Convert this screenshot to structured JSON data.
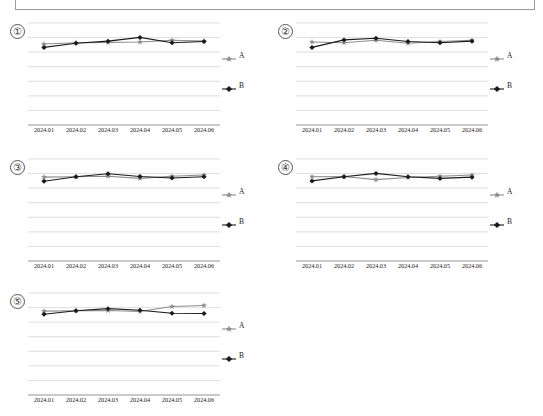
{
  "page": {
    "background": "#ffffff",
    "has_header_rule_box": true
  },
  "legend": {
    "series_a_label": "A",
    "series_b_label": "B",
    "series_a_color": "#8c8c8c",
    "series_b_color": "#1a1a1a",
    "series_a_marker": "star-marker-icon",
    "series_b_marker": "diamond-marker-icon"
  },
  "panels": [
    {
      "index_label": "①"
    },
    {
      "index_label": "②"
    },
    {
      "index_label": "③"
    },
    {
      "index_label": "④"
    },
    {
      "index_label": "⑤"
    }
  ],
  "chart_data": [
    {
      "type": "line",
      "title": "①",
      "xlabel": "",
      "ylabel": "",
      "categories": [
        "2024.01",
        "2024.02",
        "2024.03",
        "2024.04",
        "2024.05",
        "2024.06"
      ],
      "ylim": [
        0,
        8
      ],
      "grid": true,
      "gridlines": 8,
      "legend_position": "right",
      "series": [
        {
          "name": "A",
          "color": "#8c8c8c",
          "marker": "star",
          "values": [
            6.32,
            6.42,
            6.45,
            6.48,
            6.62,
            6.55
          ]
        },
        {
          "name": "B",
          "color": "#1a1a1a",
          "marker": "diamond",
          "values": [
            6.05,
            6.38,
            6.55,
            6.85,
            6.42,
            6.52
          ]
        }
      ]
    },
    {
      "type": "line",
      "title": "②",
      "xlabel": "",
      "ylabel": "",
      "categories": [
        "2024.01",
        "2024.02",
        "2024.03",
        "2024.04",
        "2024.05",
        "2024.06"
      ],
      "ylim": [
        0,
        8
      ],
      "grid": true,
      "gridlines": 8,
      "legend_position": "right",
      "series": [
        {
          "name": "A",
          "color": "#8c8c8c",
          "marker": "star",
          "values": [
            6.48,
            6.42,
            6.62,
            6.38,
            6.52,
            6.62
          ]
        },
        {
          "name": "B",
          "color": "#1a1a1a",
          "marker": "diamond",
          "values": [
            6.05,
            6.65,
            6.78,
            6.52,
            6.42,
            6.55
          ]
        }
      ]
    },
    {
      "type": "line",
      "title": "③",
      "xlabel": "",
      "ylabel": "",
      "categories": [
        "2024.01",
        "2024.02",
        "2024.03",
        "2024.04",
        "2024.05",
        "2024.06"
      ],
      "ylim": [
        0,
        8
      ],
      "grid": true,
      "gridlines": 8,
      "legend_position": "right",
      "series": [
        {
          "name": "A",
          "color": "#8c8c8c",
          "marker": "star",
          "values": [
            6.55,
            6.58,
            6.62,
            6.45,
            6.62,
            6.72
          ]
        },
        {
          "name": "B",
          "color": "#1a1a1a",
          "marker": "diamond",
          "values": [
            6.22,
            6.58,
            6.82,
            6.6,
            6.48,
            6.58
          ]
        }
      ]
    },
    {
      "type": "line",
      "title": "④",
      "xlabel": "",
      "ylabel": "",
      "categories": [
        "2024.01",
        "2024.02",
        "2024.03",
        "2024.04",
        "2024.05",
        "2024.06"
      ],
      "ylim": [
        0,
        8
      ],
      "grid": true,
      "gridlines": 8,
      "legend_position": "right",
      "series": [
        {
          "name": "A",
          "color": "#8c8c8c",
          "marker": "star",
          "values": [
            6.58,
            6.6,
            6.35,
            6.52,
            6.62,
            6.72
          ]
        },
        {
          "name": "B",
          "color": "#1a1a1a",
          "marker": "diamond",
          "values": [
            6.25,
            6.58,
            6.85,
            6.58,
            6.45,
            6.55
          ]
        }
      ]
    },
    {
      "type": "line",
      "title": "⑤",
      "xlabel": "",
      "ylabel": "",
      "categories": [
        "2024.01",
        "2024.02",
        "2024.03",
        "2024.04",
        "2024.05",
        "2024.06"
      ],
      "ylim": [
        0,
        8
      ],
      "grid": true,
      "gridlines": 8,
      "legend_position": "right",
      "series": [
        {
          "name": "A",
          "color": "#8c8c8c",
          "marker": "star",
          "values": [
            6.55,
            6.58,
            6.6,
            6.52,
            6.92,
            7.0
          ]
        },
        {
          "name": "B",
          "color": "#1a1a1a",
          "marker": "diamond",
          "values": [
            6.3,
            6.58,
            6.75,
            6.62,
            6.38,
            6.36
          ]
        }
      ]
    }
  ]
}
